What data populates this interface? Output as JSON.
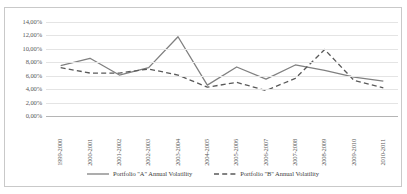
{
  "chart_data": {
    "type": "line",
    "title": "",
    "xlabel": "",
    "ylabel": "",
    "ylim": [
      0,
      14
    ],
    "ytick_step": 2,
    "grid": true,
    "legend_position": "bottom",
    "ytick_labels": [
      "14,00%",
      "12,00%",
      "10,00%",
      "8,00%",
      "6,00%",
      "4,00%",
      "2,00%",
      "0,00%"
    ],
    "ytick_values": [
      14,
      12,
      10,
      8,
      6,
      4,
      2,
      0
    ],
    "categories": [
      "1999-2000",
      "2000-2001",
      "2001-2002",
      "2002-2003",
      "2003-2004",
      "2004-2005",
      "2005-2006",
      "2006-2007",
      "2007-2008",
      "2008-2009",
      "2009-2010",
      "2010-2011"
    ],
    "series": [
      {
        "name": "Portfolio \"A\" Annual Volatility",
        "style": "solid",
        "color": "#808080",
        "values": [
          7.5,
          8.6,
          6.1,
          7.2,
          11.8,
          4.6,
          7.3,
          5.5,
          7.6,
          6.8,
          5.8,
          5.2
        ]
      },
      {
        "name": "Portfolio \"B\" Annual Volatility",
        "style": "dashed",
        "color": "#595959",
        "values": [
          7.2,
          6.4,
          6.4,
          7.0,
          6.1,
          4.3,
          5.0,
          3.8,
          5.6,
          9.9,
          5.3,
          4.2
        ]
      }
    ]
  },
  "colors": {
    "grid": "#e4e4e4",
    "axis": "#b5b5b5",
    "border": "#c9c9c9",
    "text": "#595959",
    "series_a": "#808080",
    "series_b": "#595959"
  }
}
